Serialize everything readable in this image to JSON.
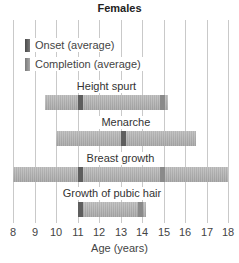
{
  "chart_data": {
    "type": "bar",
    "subtype": "horizontal-range",
    "title": "Females",
    "xlabel": "Age (years)",
    "ylabel": "",
    "xlim": [
      8,
      18
    ],
    "x_ticks": [
      8,
      9,
      10,
      11,
      12,
      13,
      14,
      15,
      16,
      17,
      18
    ],
    "grid": true,
    "legend": [
      {
        "label": "Onset (average)",
        "color": "#5e5e5e"
      },
      {
        "label": "Completion (average)",
        "color": "#8a8a8a"
      }
    ],
    "legend_position": "top-left",
    "categories": [
      "Height spurt",
      "Menarche",
      "Breast growth",
      "Growth of pubic hair"
    ],
    "series": [
      {
        "name": "Height spurt",
        "range_start": 9.5,
        "range_end": 15.2,
        "onset": 11,
        "completion": 15
      },
      {
        "name": "Menarche",
        "range_start": 10,
        "range_end": 16.5,
        "onset": 13,
        "completion": null
      },
      {
        "name": "Breast growth",
        "range_start": 8,
        "range_end": 18,
        "onset": 11,
        "completion": 15
      },
      {
        "name": "Growth of pubic hair",
        "range_start": 11,
        "range_end": 14.2,
        "onset": 11,
        "completion": 14
      }
    ]
  }
}
